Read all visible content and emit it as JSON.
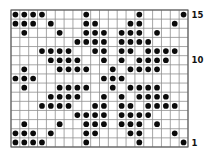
{
  "chart_data": {
    "type": "heatmap",
    "title": "",
    "columns": 20,
    "rows": 15,
    "row_labels": [
      {
        "row": 15,
        "label": "15"
      },
      {
        "row": 10,
        "label": "10"
      },
      {
        "row": 1,
        "label": "1"
      }
    ],
    "rows_top_to_bottom": [
      {
        "row": 15,
        "dots": [
          1,
          2,
          3,
          4,
          9,
          15,
          20
        ]
      },
      {
        "row": 14,
        "dots": [
          1,
          2,
          3,
          5,
          9,
          10,
          14,
          15,
          19
        ]
      },
      {
        "row": 13,
        "dots": [
          2,
          6,
          9,
          10,
          11,
          13,
          14,
          15,
          17
        ]
      },
      {
        "row": 12,
        "dots": [
          8,
          9,
          10,
          11,
          13,
          14,
          15,
          16
        ]
      },
      {
        "row": 11,
        "dots": [
          4,
          5,
          6,
          7,
          10,
          11,
          13,
          14,
          16,
          17,
          18,
          19
        ]
      },
      {
        "row": 10,
        "dots": [
          5,
          6,
          7,
          8,
          11,
          13,
          15,
          16,
          17,
          18
        ]
      },
      {
        "row": 9,
        "dots": [
          2,
          6,
          7,
          8,
          9,
          12,
          14,
          15,
          16,
          17
        ]
      },
      {
        "row": 8,
        "dots": [
          1,
          2,
          3,
          11,
          12,
          13
        ]
      },
      {
        "row": 7,
        "dots": [
          2,
          6,
          7,
          8,
          9,
          12,
          14,
          15,
          16,
          17
        ]
      },
      {
        "row": 6,
        "dots": [
          5,
          6,
          7,
          8,
          11,
          13,
          15,
          16,
          17,
          18
        ]
      },
      {
        "row": 5,
        "dots": [
          4,
          5,
          6,
          7,
          10,
          11,
          13,
          14,
          16,
          17,
          18,
          19
        ]
      },
      {
        "row": 4,
        "dots": [
          8,
          9,
          10,
          11,
          13,
          14,
          15,
          16
        ]
      },
      {
        "row": 3,
        "dots": [
          2,
          6,
          9,
          10,
          11,
          13,
          14,
          15,
          17
        ]
      },
      {
        "row": 2,
        "dots": [
          1,
          2,
          3,
          5,
          9,
          10,
          14,
          15,
          19
        ]
      },
      {
        "row": 1,
        "dots": [
          1,
          2,
          3,
          4,
          9,
          15,
          20
        ]
      }
    ],
    "layout": {
      "grid_left": 11,
      "grid_top": 10,
      "grid_right": 188,
      "grid_bottom": 147,
      "label_x": 191.5,
      "label_font_size": 8.5,
      "dot_radius": 2.85,
      "canvas_width": 212,
      "canvas_height": 159
    },
    "colors": {
      "background": "#ffffff",
      "grid_line": "#8f8f8f",
      "outer_border": "#5a5a5a",
      "dot": "#0a0a0a",
      "label": "#111111"
    }
  }
}
